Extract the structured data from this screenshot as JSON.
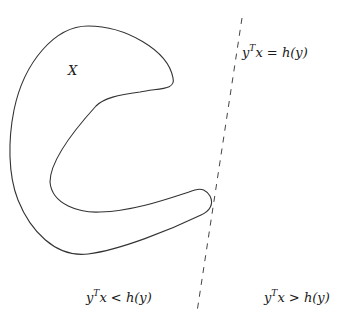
{
  "diagram": {
    "set_label": "X",
    "hyperplane_label": {
      "lhs": "y",
      "sup": "T",
      "rest": "x = ",
      "rhs": "h(y)"
    },
    "halfspace_left_label": {
      "lhs": "y",
      "sup": "T",
      "rest": "x < ",
      "rhs": "h(y)"
    },
    "halfspace_right_label": {
      "lhs": "y",
      "sup": "T",
      "rest": "x > ",
      "rhs": "h(y)"
    },
    "colors": {
      "stroke": "#333333",
      "background": "#ffffff"
    }
  }
}
